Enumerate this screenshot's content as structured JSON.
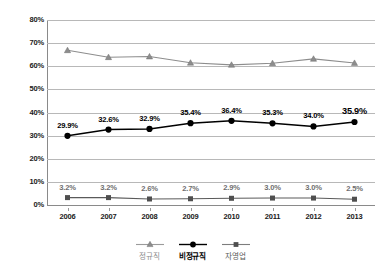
{
  "chart_data": {
    "type": "line",
    "title": "",
    "xlabel": "",
    "ylabel": "",
    "categories": [
      "2006",
      "2007",
      "2008",
      "2009",
      "2010",
      "2011",
      "2012",
      "2013"
    ],
    "ylim": [
      0,
      80
    ],
    "yticks": [
      "0%",
      "10%",
      "20%",
      "30%",
      "40%",
      "50%",
      "60%",
      "70%",
      "80%"
    ],
    "ytick_values": [
      0,
      10,
      20,
      30,
      40,
      50,
      60,
      70,
      80
    ],
    "grid": true,
    "legend_position": "bottom",
    "series": [
      {
        "name": "정규직",
        "marker": "triangle",
        "color": "#8d8d8d",
        "labels_shown": false,
        "values": [
          66.9,
          63.9,
          64.2,
          61.5,
          60.6,
          61.3,
          63.2,
          61.4
        ],
        "labels": [
          "",
          "",
          "",
          "",
          "",
          "",
          "",
          ""
        ]
      },
      {
        "name": "비정규직",
        "marker": "circle",
        "color": "#000000",
        "labels_shown": true,
        "values": [
          29.9,
          32.6,
          32.9,
          35.4,
          36.4,
          35.3,
          34.0,
          35.9
        ],
        "labels": [
          "29.9%",
          "32.6%",
          "32.9%",
          "35.4%",
          "36.4%",
          "35.3%",
          "34.0%",
          "35.9%"
        ]
      },
      {
        "name": "자영업",
        "marker": "square",
        "color": "#5a5a5a",
        "labels_shown": true,
        "values": [
          3.2,
          3.2,
          2.6,
          2.7,
          2.9,
          3.0,
          3.0,
          2.5
        ],
        "labels": [
          "3.2%",
          "3.2%",
          "2.6%",
          "2.7%",
          "2.9%",
          "3.0%",
          "3.0%",
          "2.5%"
        ]
      }
    ]
  },
  "legend": {
    "items": [
      {
        "label": "정규직"
      },
      {
        "label": "비정규직"
      },
      {
        "label": "자영업"
      }
    ]
  },
  "colors": {
    "regular": "#8d8d8d",
    "nonregular": "#000000",
    "selfemployed": "#5a5a5a",
    "grid": "#b8b8b8",
    "axis": "#8a8a8a",
    "background": "#ffffff"
  }
}
